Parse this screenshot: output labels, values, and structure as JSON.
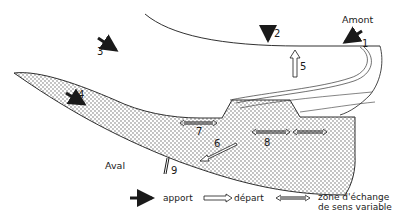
{
  "diagram": {
    "places": {
      "upstream": "Amont",
      "downstream": "Aval"
    },
    "flow_labels": {
      "n1": "1",
      "n2": "2",
      "n3": "3",
      "n4": "4",
      "n5": "5",
      "n6": "6",
      "n7": "7",
      "n8": "8",
      "n9": "9"
    },
    "legend": {
      "inflow": "apport",
      "outflow": "départ",
      "exchange_line1": "zone d'échange",
      "exchange_line2": "de sens variable"
    },
    "colors": {
      "ink": "#1a1a1a",
      "stipple": "#555555",
      "background": "#ffffff"
    }
  }
}
